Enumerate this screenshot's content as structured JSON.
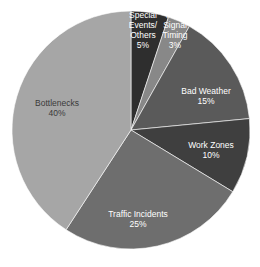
{
  "chart_data": {
    "type": "pie",
    "title": "",
    "start_angle_deg": 0,
    "direction": "clockwise",
    "center": [
      131,
      130
    ],
    "radius": 119,
    "slices": [
      {
        "label": "Special Events/ Others",
        "label_lines": [
          "Special",
          "Events/",
          "Others"
        ],
        "value": 5,
        "pct_text": "5%",
        "color": "#2e2e2e",
        "label_pos": [
          143,
          33
        ],
        "label_color": "#ffffff"
      },
      {
        "label": "Poor Signal Timing",
        "label_lines": [
          "Poor",
          "Signal",
          "Timing"
        ],
        "value": 3,
        "pct_text": "3%",
        "color": "#888888",
        "label_pos": [
          175,
          33
        ],
        "label_color": "#ffffff"
      },
      {
        "label": "Bad Weather",
        "label_lines": [
          "Bad Weather"
        ],
        "value": 15,
        "pct_text": "15%",
        "color": "#5a5a5a",
        "label_pos": [
          206,
          99
        ],
        "label_color": "#ffffff"
      },
      {
        "label": "Work Zones",
        "label_lines": [
          "Work Zones"
        ],
        "value": 10,
        "pct_text": "10%",
        "color": "#3f3f3f",
        "label_pos": [
          211,
          153
        ],
        "label_color": "#ffffff"
      },
      {
        "label": "Traffic Incidents",
        "label_lines": [
          "Traffic Incidents"
        ],
        "value": 25,
        "pct_text": "25%",
        "color": "#6e6e6e",
        "label_pos": [
          138,
          222
        ],
        "label_color": "#ffffff"
      },
      {
        "label": "Bottlenecks",
        "label_lines": [
          "Bottlenecks"
        ],
        "value": 40,
        "pct_text": "40%",
        "color": "#a6a6a6",
        "label_pos": [
          57,
          111
        ],
        "label_color": "#3a3a3a"
      }
    ],
    "legend": "none (data labels on slices)"
  }
}
